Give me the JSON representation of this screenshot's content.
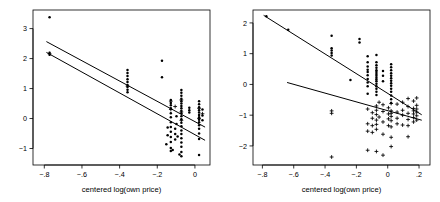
{
  "figure": {
    "width": 440,
    "height": 202,
    "background": "#ffffff",
    "foreground": "#000000",
    "panel_count": 2
  },
  "chart_data": [
    {
      "panel": "left",
      "type": "scatter",
      "title": "",
      "xlabel": "centered log(own price)",
      "ylabel": "",
      "xlim": [
        -0.86,
        0.08
      ],
      "ylim": [
        -1.55,
        3.62
      ],
      "grid": false,
      "legend": "none",
      "xticks": [
        -0.8,
        -0.6,
        -0.4,
        -0.2,
        0
      ],
      "xticklabels": [
        "−.8",
        "−.6",
        "−.4",
        "−.2",
        "0"
      ],
      "yticks": [
        -1,
        0,
        1,
        2,
        3
      ],
      "yticklabels": [
        "−1",
        "0",
        "1",
        "2",
        "3"
      ],
      "series": [
        {
          "name": "group-dot",
          "marker": "dot",
          "points": [
            [
              -0.772,
              3.38
            ],
            [
              -0.772,
              2.19
            ],
            [
              -0.772,
              2.13
            ],
            [
              -0.358,
              1.62
            ],
            [
              -0.358,
              1.52
            ],
            [
              -0.358,
              1.42
            ],
            [
              -0.358,
              1.31
            ],
            [
              -0.358,
              1.22
            ],
            [
              -0.358,
              1.12
            ],
            [
              -0.358,
              1.05
            ],
            [
              -0.358,
              0.96
            ],
            [
              -0.358,
              0.88
            ],
            [
              -0.175,
              1.93
            ],
            [
              -0.175,
              1.38
            ],
            [
              -0.128,
              0.62
            ],
            [
              -0.128,
              0.52
            ],
            [
              -0.128,
              0.44
            ],
            [
              -0.128,
              0.34
            ],
            [
              -0.128,
              0.18
            ],
            [
              -0.128,
              0.04
            ],
            [
              -0.128,
              -0.12
            ],
            [
              -0.128,
              -0.28
            ],
            [
              -0.128,
              -0.44
            ],
            [
              -0.128,
              -0.62
            ],
            [
              -0.128,
              -0.78
            ],
            [
              -0.128,
              -0.98
            ],
            [
              -0.128,
              -1.08
            ],
            [
              -0.072,
              0.95
            ],
            [
              -0.072,
              0.86
            ],
            [
              -0.072,
              0.76
            ],
            [
              -0.072,
              0.66
            ],
            [
              -0.072,
              0.58
            ],
            [
              -0.072,
              0.5
            ],
            [
              -0.072,
              0.42
            ],
            [
              -0.072,
              0.34
            ],
            [
              -0.072,
              0.26
            ],
            [
              -0.072,
              0.18
            ],
            [
              -0.072,
              0.08
            ],
            [
              -0.072,
              -0.02
            ],
            [
              -0.072,
              -0.14
            ],
            [
              -0.072,
              -0.26
            ],
            [
              -0.072,
              -0.4
            ],
            [
              -0.072,
              -0.52
            ],
            [
              -0.072,
              -0.66
            ],
            [
              -0.072,
              -0.8
            ],
            [
              -0.072,
              -0.94
            ],
            [
              -0.072,
              -1.12
            ],
            [
              -0.072,
              -1.26
            ],
            [
              -0.105,
              -0.34
            ],
            [
              -0.105,
              -0.52
            ],
            [
              -0.105,
              -0.7
            ],
            [
              -0.098,
              0.08
            ],
            [
              -0.098,
              -0.18
            ],
            [
              -0.145,
              -0.3
            ],
            [
              -0.145,
              -0.56
            ],
            [
              -0.152,
              -0.86
            ],
            [
              -0.118,
              -1.05
            ],
            [
              -0.092,
              -0.6
            ],
            [
              -0.082,
              -1.2
            ],
            [
              -0.03,
              0.36
            ],
            [
              -0.03,
              0.28
            ],
            [
              -0.03,
              0.2
            ],
            [
              0.022,
              0.58
            ],
            [
              0.022,
              0.48
            ],
            [
              0.022,
              0.38
            ],
            [
              0.022,
              0.28
            ],
            [
              0.022,
              0.2
            ],
            [
              0.022,
              0.12
            ],
            [
              0.022,
              0.04
            ],
            [
              0.022,
              -0.04
            ],
            [
              0.022,
              -0.12
            ],
            [
              0.022,
              -0.22
            ],
            [
              0.022,
              -0.34
            ],
            [
              0.022,
              -0.5
            ],
            [
              0.022,
              -0.68
            ],
            [
              0.022,
              -1.22
            ],
            [
              0.04,
              0.3
            ],
            [
              0.04,
              0.1
            ],
            [
              0.04,
              -0.06
            ]
          ]
        },
        {
          "name": "group-plus",
          "marker": "plus",
          "points": [
            [
              -0.772,
              2.16
            ],
            [
              -0.358,
              1.08
            ],
            [
              -0.128,
              0.58
            ],
            [
              -0.128,
              0.3
            ],
            [
              -0.072,
              0.62
            ],
            [
              -0.072,
              0.22
            ],
            [
              -0.072,
              -0.06
            ],
            [
              -0.105,
              0.4
            ],
            [
              0.022,
              0.34
            ],
            [
              0.022,
              0.0
            ],
            [
              0.04,
              0.16
            ]
          ]
        }
      ],
      "lines": [
        {
          "name": "regression-line-1",
          "x0": -0.787,
          "y0": 2.56,
          "x1": 0.052,
          "y1": -0.28
        },
        {
          "name": "regression-line-2",
          "x0": -0.787,
          "y0": 2.2,
          "x1": 0.052,
          "y1": -0.72
        }
      ]
    },
    {
      "panel": "right",
      "type": "scatter",
      "title": "",
      "xlabel": "centered log(own price)",
      "ylabel": "",
      "xlim": [
        -0.86,
        0.27
      ],
      "ylim": [
        -2.62,
        2.42
      ],
      "grid": false,
      "legend": "none",
      "xticks": [
        -0.8,
        -0.6,
        -0.4,
        -0.2,
        0,
        0.2
      ],
      "xticklabels": [
        "−.8",
        "−.6",
        "−.4",
        "−.2",
        "0",
        ".2"
      ],
      "yticks": [
        -2,
        -1,
        0,
        1,
        2
      ],
      "yticklabels": [
        "−2",
        "−1",
        "0",
        "1",
        "2"
      ],
      "series": [
        {
          "name": "group-dot",
          "marker": "dot",
          "points": [
            [
              -0.775,
              2.22
            ],
            [
              -0.635,
              1.78
            ],
            [
              -0.358,
              1.58
            ],
            [
              -0.358,
              1.18
            ],
            [
              -0.358,
              1.1
            ],
            [
              -0.358,
              1.02
            ],
            [
              -0.358,
              0.94
            ],
            [
              -0.238,
              0.14
            ],
            [
              -0.18,
              1.48
            ],
            [
              -0.18,
              1.36
            ],
            [
              -0.128,
              0.92
            ],
            [
              -0.128,
              0.72
            ],
            [
              -0.128,
              0.58
            ],
            [
              -0.128,
              0.48
            ],
            [
              -0.128,
              0.4
            ],
            [
              -0.128,
              0.3
            ],
            [
              -0.128,
              0.18
            ],
            [
              -0.128,
              0.06
            ],
            [
              -0.128,
              -0.06
            ],
            [
              -0.128,
              -0.3
            ],
            [
              -0.072,
              0.96
            ],
            [
              -0.072,
              0.72
            ],
            [
              -0.072,
              0.62
            ],
            [
              -0.072,
              0.54
            ],
            [
              -0.072,
              0.46
            ],
            [
              -0.072,
              0.4
            ],
            [
              -0.072,
              0.34
            ],
            [
              -0.072,
              0.28
            ],
            [
              -0.072,
              0.22
            ],
            [
              -0.072,
              0.16
            ],
            [
              -0.072,
              0.1
            ],
            [
              -0.072,
              0.02
            ],
            [
              -0.072,
              -0.06
            ],
            [
              -0.072,
              -0.14
            ],
            [
              -0.072,
              -0.24
            ],
            [
              -0.072,
              -0.34
            ],
            [
              -0.03,
              0.44
            ],
            [
              -0.03,
              0.28
            ],
            [
              -0.03,
              0.1
            ],
            [
              0.022,
              0.66
            ],
            [
              0.022,
              0.56
            ],
            [
              0.022,
              0.46
            ],
            [
              0.022,
              0.36
            ],
            [
              0.022,
              0.28
            ],
            [
              0.022,
              0.2
            ],
            [
              0.022,
              0.12
            ],
            [
              0.022,
              0.04
            ],
            [
              0.022,
              -0.04
            ],
            [
              0.022,
              -0.14
            ],
            [
              0.022,
              -0.24
            ],
            [
              0.022,
              -0.36
            ],
            [
              0.022,
              -0.48
            ],
            [
              0.022,
              -0.6
            ]
          ]
        },
        {
          "name": "group-plus",
          "marker": "plus",
          "points": [
            [
              -0.358,
              -0.86
            ],
            [
              -0.358,
              -0.94
            ],
            [
              -0.358,
              -2.36
            ],
            [
              -0.128,
              -0.8
            ],
            [
              -0.128,
              -1.28
            ],
            [
              -0.128,
              -1.52
            ],
            [
              -0.128,
              -2.14
            ],
            [
              -0.098,
              -0.92
            ],
            [
              -0.098,
              -1.1
            ],
            [
              -0.098,
              -1.34
            ],
            [
              -0.098,
              -1.56
            ],
            [
              -0.072,
              -0.7
            ],
            [
              -0.072,
              -0.84
            ],
            [
              -0.072,
              -0.98
            ],
            [
              -0.072,
              -1.16
            ],
            [
              -0.072,
              -1.3
            ],
            [
              -0.072,
              -1.46
            ],
            [
              -0.072,
              -2.18
            ],
            [
              -0.055,
              -0.58
            ],
            [
              -0.055,
              -1.06
            ],
            [
              -0.03,
              -0.66
            ],
            [
              -0.03,
              -0.88
            ],
            [
              -0.03,
              -1.22
            ],
            [
              -0.03,
              -1.62
            ],
            [
              -0.03,
              -2.3
            ],
            [
              0.005,
              -0.76
            ],
            [
              0.005,
              -0.96
            ],
            [
              0.005,
              -1.12
            ],
            [
              0.005,
              -1.34
            ],
            [
              0.022,
              -0.62
            ],
            [
              0.022,
              -0.86
            ],
            [
              0.022,
              -0.94
            ],
            [
              0.022,
              -1.04
            ],
            [
              0.022,
              -1.18
            ],
            [
              0.022,
              -1.38
            ],
            [
              0.022,
              -1.72
            ],
            [
              0.022,
              -2.02
            ],
            [
              0.06,
              -0.64
            ],
            [
              0.06,
              -0.9
            ],
            [
              0.06,
              -1.1
            ],
            [
              0.06,
              -1.28
            ],
            [
              0.095,
              -0.58
            ],
            [
              0.095,
              -0.84
            ],
            [
              0.095,
              -1.0
            ],
            [
              0.095,
              -1.32
            ],
            [
              0.13,
              -0.46
            ],
            [
              0.13,
              -0.72
            ],
            [
              0.13,
              -0.94
            ],
            [
              0.13,
              -1.14
            ],
            [
              0.13,
              -1.34
            ],
            [
              0.13,
              -1.7
            ],
            [
              0.165,
              -0.54
            ],
            [
              0.165,
              -0.78
            ],
            [
              0.165,
              -0.86
            ],
            [
              0.165,
              -0.96
            ],
            [
              0.165,
              -1.08
            ],
            [
              0.165,
              -1.22
            ],
            [
              0.185,
              -0.44
            ],
            [
              0.185,
              -0.68
            ],
            [
              0.185,
              -0.8
            ],
            [
              0.185,
              -0.9
            ],
            [
              0.185,
              -1.02
            ],
            [
              0.185,
              -1.16
            ]
          ]
        }
      ],
      "lines": [
        {
          "name": "regression-line-1",
          "x0": -0.79,
          "y0": 2.24,
          "x1": 0.215,
          "y1": -0.98
        },
        {
          "name": "regression-line-2",
          "x0": -0.64,
          "y0": 0.06,
          "x1": 0.215,
          "y1": -1.16
        }
      ]
    }
  ]
}
